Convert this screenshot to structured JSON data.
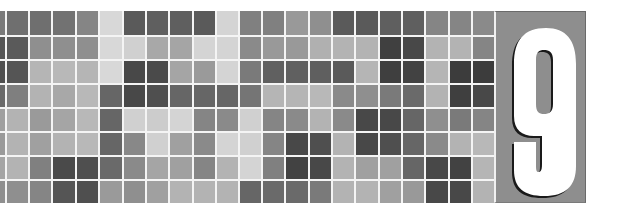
{
  "chapter": {
    "number": "9",
    "numeral_color": "#ffffff",
    "shadow_color": "#1a1a1a",
    "panel_color": "#8e8e8e"
  },
  "mosaic": {
    "rows": 8,
    "columns": 22,
    "col_edges": [
      0,
      5,
      28,
      51,
      75,
      98,
      122,
      145,
      168,
      192,
      215,
      238,
      261,
      284,
      308,
      331,
      354,
      378,
      401,
      424,
      448,
      471,
      494
    ],
    "row_edges": [
      0,
      24,
      48,
      72,
      96,
      120,
      144,
      168,
      192
    ],
    "gap": 2,
    "gap_color": "#f4f4f4",
    "cells": [
      [
        "#7a7a7a",
        "#6f6f6f",
        "#6f6f6f",
        "#727272",
        "#858585",
        "#d8d8d8",
        "#5a5a5a",
        "#5f5f5f",
        "#5f5f5f",
        "#5a5a5a",
        "#d4d4d4",
        "#808080",
        "#808080",
        "#999999",
        "#8f8f8f",
        "#5a5a5a",
        "#5a5a5a",
        "#5f5f5f",
        "#5f5f5f",
        "#858585",
        "#858585",
        "#8a8a8a"
      ],
      [
        "#555555",
        "#5a5a5a",
        "#8f8f8f",
        "#8f8f8f",
        "#8f8f8f",
        "#d8d8d8",
        "#d0d0d0",
        "#a8a8a8",
        "#a5a5a5",
        "#d4d4d4",
        "#d4d4d4",
        "#8a8a8a",
        "#999999",
        "#999999",
        "#b0b0b0",
        "#b3b3b3",
        "#b3b3b3",
        "#404040",
        "#484848",
        "#b3b3b3",
        "#b3b3b3",
        "#858585"
      ],
      [
        "#505050",
        "#555555",
        "#b5b5b5",
        "#b8b8b8",
        "#b5b5b5",
        "#d8d8d8",
        "#484848",
        "#4a4a4a",
        "#a5a5a5",
        "#9a9a9a",
        "#d4d4d4",
        "#7a7a7a",
        "#606060",
        "#606060",
        "#5f5f5f",
        "#5a5a5a",
        "#b5b5b5",
        "#3f3f3f",
        "#424242",
        "#b5b5b5",
        "#3c3c3c",
        "#3c3c3c"
      ],
      [
        "#6a6a6a",
        "#7f7f7f",
        "#b3b3b3",
        "#a8a8a8",
        "#b8b8b8",
        "#666666",
        "#484848",
        "#4f4f4f",
        "#666666",
        "#666666",
        "#666666",
        "#757575",
        "#b5b5b5",
        "#b5b5b5",
        "#b8b8b8",
        "#8a8a8a",
        "#8f8f8f",
        "#7a7a7a",
        "#6a6a6a",
        "#b3b3b3",
        "#3f3f3f",
        "#484848"
      ],
      [
        "#a0a0a0",
        "#b3b3b3",
        "#9a9a9a",
        "#a5a5a5",
        "#b8b8b8",
        "#666666",
        "#d0d0d0",
        "#cccccc",
        "#d4d4d4",
        "#858585",
        "#8a8a8a",
        "#d0d0d0",
        "#858585",
        "#8a8a8a",
        "#b3b3b3",
        "#8a8a8a",
        "#484848",
        "#484848",
        "#666666",
        "#8f8f8f",
        "#7a7a7a",
        "#858585"
      ],
      [
        "#9a9a9a",
        "#b3b3b3",
        "#a0a0a0",
        "#b3b3b3",
        "#b8b8b8",
        "#666666",
        "#888888",
        "#d0d0d0",
        "#a0a0a0",
        "#8a8a8a",
        "#d4d4d4",
        "#d0d0d0",
        "#858585",
        "#484848",
        "#4f4f4f",
        "#b3b3b3",
        "#484848",
        "#4f4f4f",
        "#666666",
        "#8a8a8a",
        "#b3b3b3",
        "#b8b8b8"
      ],
      [
        "#a5a5a5",
        "#b3b3b3",
        "#808080",
        "#4a4a4a",
        "#4f4f4f",
        "#6a6a6a",
        "#8a8a8a",
        "#a5a5a5",
        "#a0a0a0",
        "#858585",
        "#b3b3b3",
        "#d4d4d4",
        "#808080",
        "#424242",
        "#484848",
        "#b3b3b3",
        "#a0a0a0",
        "#a0a0a0",
        "#666666",
        "#484848",
        "#424242",
        "#b5b5b5"
      ],
      [
        "#8f8f8f",
        "#8f8f8f",
        "#858585",
        "#555555",
        "#4f4f4f",
        "#9a9a9a",
        "#8f8f8f",
        "#a0a0a0",
        "#b3b3b3",
        "#b3b3b3",
        "#b3b3b3",
        "#666666",
        "#6a6a6a",
        "#6a6a6a",
        "#7a7a7a",
        "#b3b3b3",
        "#b3b3b3",
        "#a0a0a0",
        "#999999",
        "#484848",
        "#484848",
        "#b3b3b3"
      ]
    ]
  }
}
